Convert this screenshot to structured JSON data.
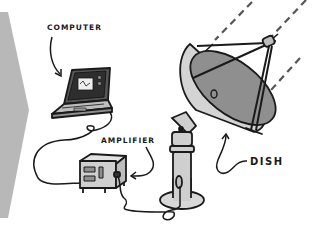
{
  "diagram": {
    "labels": {
      "computer": "COMPUTER",
      "amplifier": "AMPLIFIER",
      "dish": "DISH"
    },
    "colors": {
      "chevron": "#b5b5b5",
      "line": "#1a1a1a",
      "dish_dark": "#8f8f8f",
      "dish_light": "#d4d4d4",
      "body_light": "#cfcfcf",
      "background": "#ffffff"
    },
    "components": [
      "computer",
      "amplifier",
      "dish"
    ],
    "connections": [
      {
        "from": "computer",
        "to": "amplifier"
      },
      {
        "from": "amplifier",
        "to": "dish"
      }
    ]
  }
}
